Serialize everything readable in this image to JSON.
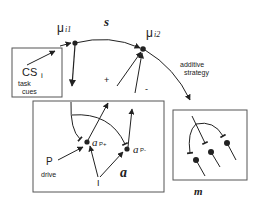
{
  "diagram": {
    "nodes": {
      "mu1": {
        "label": "μ",
        "sub": "i1"
      },
      "mu2": {
        "label": "μ",
        "sub": "i2"
      },
      "ap_plus": {
        "label": "a",
        "sub": "P+"
      },
      "ap_minus": {
        "label": "a",
        "sub": "P-"
      }
    },
    "labels": {
      "s_region": "s",
      "a_region": "a",
      "m_region": "m",
      "cs": "CS",
      "cs_sub": "i",
      "task": "task",
      "cues": "cues",
      "p": "P",
      "drive": "drive",
      "i": "I",
      "plus": "+",
      "minus": "-",
      "additive": "additive",
      "strategy": "strategy"
    },
    "colors": {
      "line": "#222222",
      "box": "#555555",
      "background": "#ffffff"
    }
  }
}
